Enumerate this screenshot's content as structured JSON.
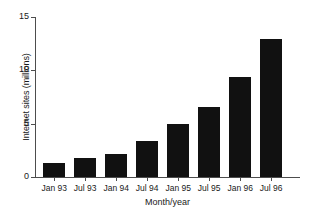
{
  "chart_data": {
    "type": "bar",
    "title": "",
    "xlabel": "Month/year",
    "ylabel": "Internet sites (millions)",
    "categories": [
      "Jan 93",
      "Jul 93",
      "Jan 94",
      "Jul 94",
      "Jan 95",
      "Jul 95",
      "Jan 96",
      "Jul 96"
    ],
    "values": [
      1.3,
      1.8,
      2.2,
      3.4,
      5.0,
      6.6,
      9.4,
      12.9
    ],
    "ylim": [
      0,
      15
    ],
    "yticks": [
      0,
      5,
      10,
      15
    ],
    "ytick_labels": [
      "0",
      "5",
      "10",
      "15"
    ],
    "grid": false,
    "legend": null,
    "bar_color": "#111111",
    "axis_color": "#4d4d4d",
    "background": "#ffffff"
  }
}
